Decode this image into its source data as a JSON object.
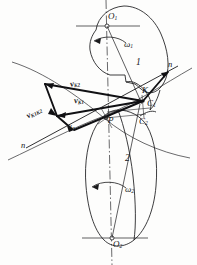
{
  "figure": {
    "type": "kinematics-diagram",
    "background_color": "#fdfdfc",
    "line_color": "#1a1a1c",
    "thick_line_color": "#101013"
  },
  "bodies": [
    {
      "id": "body-1",
      "label": "1",
      "center_label": "O",
      "center_sub": "1",
      "omega_label": "ω",
      "omega_sub": "1"
    },
    {
      "id": "body-2",
      "label": "2",
      "center_label": "O",
      "center_sub": "2",
      "omega_label": "ω",
      "omega_sub": "2"
    }
  ],
  "points": [
    {
      "name": "center-upper",
      "label": "O",
      "sub": "1",
      "x": 112,
      "y": 18
    },
    {
      "name": "contact-point-k",
      "label": "K",
      "sub": "",
      "x": 143,
      "y": 92
    },
    {
      "name": "point-c1",
      "label": "C",
      "sub": "1",
      "x": 148,
      "y": 103
    },
    {
      "name": "pitch-point-p",
      "label": "P",
      "sub": "",
      "x": 109,
      "y": 119
    },
    {
      "name": "point-c2",
      "label": "C",
      "sub": "2",
      "x": 140,
      "y": 120
    },
    {
      "name": "center-lower",
      "label": "O",
      "sub": "2",
      "x": 115,
      "y": 243
    }
  ],
  "vectors": [
    {
      "name": "velocity-k2",
      "label": "v",
      "sub": "K2",
      "x": 72,
      "y": 84
    },
    {
      "name": "velocity-k1",
      "label": "v",
      "sub": "K1",
      "x": 75,
      "y": 100
    },
    {
      "name": "velocity-k1k2",
      "label": "v",
      "sub": "K1K2",
      "x": 30,
      "y": 113
    },
    {
      "name": "velocity-normal",
      "label": "v",
      "sub": "n",
      "x": 69,
      "y": 124
    }
  ],
  "normal_line": {
    "name": "common-normal",
    "label_upper": "n",
    "label_lower": "n",
    "upper_x": 169,
    "upper_y": 68,
    "lower_x": 22,
    "lower_y": 145
  },
  "body_numbers": [
    {
      "name": "body-number-1",
      "text": "1",
      "x": 136,
      "y": 63
    },
    {
      "name": "body-number-2",
      "text": "2",
      "x": 125,
      "y": 158
    }
  ],
  "omegas": [
    {
      "name": "omega-1",
      "label": "ω",
      "sub": "1",
      "x": 126,
      "y": 46
    },
    {
      "name": "omega-2",
      "label": "ω",
      "sub": "2",
      "x": 126,
      "y": 191
    }
  ]
}
